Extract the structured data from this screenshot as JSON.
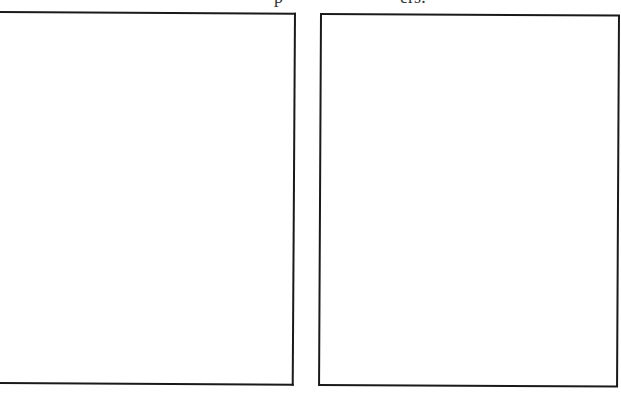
{
  "page": {
    "type": "scanned-document",
    "heading": {
      "visible": "clipped",
      "fragment_left": "p",
      "fragment_right": "ers:"
    },
    "panels": [
      {
        "id": "left",
        "content": ""
      },
      {
        "id": "right",
        "content": ""
      }
    ],
    "colors": {
      "background": "#ffffff",
      "border": "#1a1a1a"
    }
  }
}
